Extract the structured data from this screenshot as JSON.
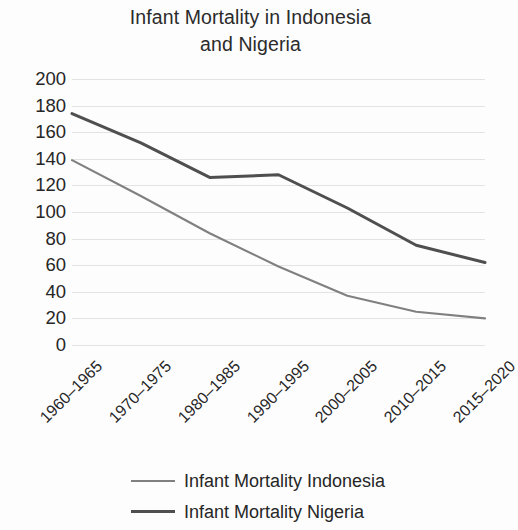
{
  "chart_data": {
    "type": "line",
    "title": "Infant Mortality in Indonesia and Nigeria",
    "title_line1": "Infant Mortality in Indonesia",
    "title_line2": "and Nigeria",
    "xlabel": "",
    "ylabel": "",
    "categories": [
      "1960–1965",
      "1970–1975",
      "1980–1985",
      "1990–1995",
      "2000–2005",
      "2010–2015",
      "2015–2020"
    ],
    "ylim": [
      0,
      200
    ],
    "ytick_labels": [
      "200",
      "180",
      "160",
      "140",
      "120",
      "100",
      "80",
      "60",
      "40",
      "20",
      "0"
    ],
    "ytick_values": [
      200,
      180,
      160,
      140,
      120,
      100,
      80,
      60,
      40,
      20,
      0
    ],
    "grid": true,
    "grid_color": "#e3e3e3",
    "legend_position": "bottom",
    "series": [
      {
        "name": "Infant Mortality Indonesia",
        "values": [
          139,
          112,
          84,
          59,
          37,
          25,
          20
        ],
        "color": "#808080",
        "width": 2.1
      },
      {
        "name": "Infant Mortality Nigeria",
        "values": [
          174,
          152,
          126,
          128,
          103,
          75,
          62
        ],
        "color": "#4f4f4f",
        "width": 3.0
      }
    ]
  },
  "legend": {
    "items": [
      {
        "label": "Infant Mortality Indonesia",
        "color": "#808080",
        "width": 2.1
      },
      {
        "label": "Infant Mortality Nigeria",
        "color": "#4f4f4f",
        "width": 3.0
      }
    ]
  },
  "colors": {
    "background": "#fdfdfd",
    "text": "#262626",
    "grid": "#e3e3e3",
    "indonesia": "#808080",
    "nigeria": "#4f4f4f"
  }
}
